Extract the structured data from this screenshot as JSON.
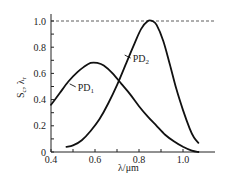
{
  "chart_data": {
    "type": "line",
    "title": "",
    "xlabel": "λ/μm",
    "ylabel": "S_c, λ_r",
    "ylabel_main": "S",
    "ylabel_sub": "c",
    "ylabel_sep": ", λ",
    "ylabel_sub2": "r",
    "xlim": [
      0.4,
      1.15
    ],
    "ylim": [
      0,
      1.05
    ],
    "xticks": [
      0.4,
      0.5,
      0.6,
      0.7,
      0.8,
      0.9,
      1.0
    ],
    "xtick_labels": [
      "0.4",
      "",
      "0.6",
      "",
      "0.8",
      "",
      "1.0"
    ],
    "yticks": [
      0,
      0.1,
      0.2,
      0.3,
      0.4,
      0.5,
      0.6,
      0.7,
      0.8,
      0.9,
      1.0
    ],
    "ytick_labels": [
      "0",
      "",
      "0.2",
      "",
      "0.4",
      "",
      "0.6",
      "",
      "0.8",
      "",
      "1.0"
    ],
    "reference_line": {
      "y": 1.0,
      "style": "dashed"
    },
    "grid": false,
    "legend": "inline-annotations",
    "series": [
      {
        "name": "PD1",
        "label_main": "PD",
        "label_sub": "1",
        "x": [
          0.4,
          0.44,
          0.48,
          0.52,
          0.55,
          0.58,
          0.61,
          0.64,
          0.68,
          0.72,
          0.76,
          0.8,
          0.84,
          0.88,
          0.92,
          0.96,
          1.0,
          1.04,
          1.07
        ],
        "y": [
          0.36,
          0.45,
          0.54,
          0.61,
          0.65,
          0.68,
          0.68,
          0.66,
          0.6,
          0.52,
          0.44,
          0.35,
          0.27,
          0.2,
          0.13,
          0.08,
          0.04,
          0.01,
          0.0
        ],
        "label_at": {
          "x": 0.485,
          "y": 0.52
        }
      },
      {
        "name": "PD2",
        "label_main": "PD",
        "label_sub": "2",
        "x": [
          0.47,
          0.5,
          0.54,
          0.58,
          0.62,
          0.66,
          0.7,
          0.74,
          0.78,
          0.81,
          0.84,
          0.86,
          0.88,
          0.91,
          0.94,
          0.97,
          1.0,
          1.03,
          1.05,
          1.07
        ],
        "y": [
          0.04,
          0.05,
          0.09,
          0.16,
          0.25,
          0.37,
          0.51,
          0.67,
          0.83,
          0.94,
          1.0,
          1.0,
          0.97,
          0.85,
          0.67,
          0.48,
          0.32,
          0.18,
          0.11,
          0.07
        ],
        "label_at": {
          "x": 0.735,
          "y": 0.74
        }
      }
    ]
  }
}
